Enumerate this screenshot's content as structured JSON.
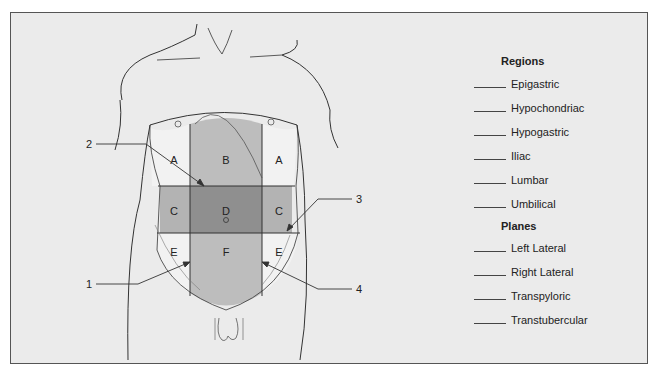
{
  "figure": {
    "region_labels": {
      "A_left": "A",
      "B": "B",
      "A_right": "A",
      "C_left": "C",
      "D": "D",
      "C_right": "C",
      "E_left": "E",
      "F": "F",
      "E_right": "E"
    },
    "callouts": {
      "1": "1",
      "2": "2",
      "3": "3",
      "4": "4"
    },
    "colors": {
      "background": "#ebebeb",
      "lateral_upper": "#f2f2f2",
      "central_upper": "#bdbdbd",
      "lateral_middle": "#b3b3b3",
      "central_middle": "#8f8f8f",
      "lateral_lower": "#f2f2f2",
      "central_lower": "#bdbdbd",
      "line": "#333333"
    }
  },
  "key": {
    "regions_heading": "Regions",
    "regions": [
      "Epigastric",
      "Hypochondriac",
      "Hypogastric",
      "Iliac",
      "Lumbar",
      "Umbilical"
    ],
    "planes_heading": "Planes",
    "planes": [
      "Left Lateral",
      "Right Lateral",
      "Transpyloric",
      "Transtubercular"
    ]
  }
}
